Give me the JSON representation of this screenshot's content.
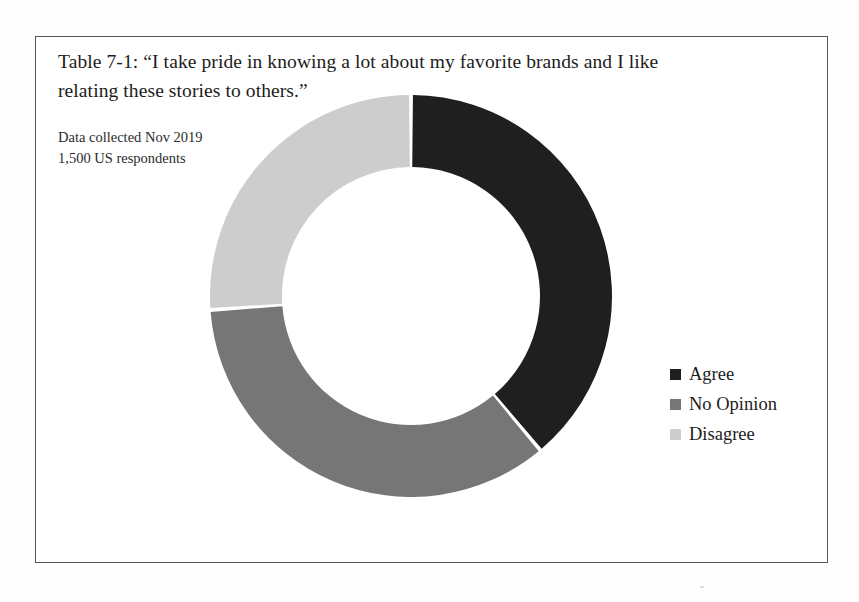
{
  "figure": {
    "title": "Table 7-1: “I take pride in knowing a lot about my favorite brands and I like relating these stories to others.”",
    "subtitle_line1": "Data collected Nov 2019",
    "subtitle_line2": "1,500 US respondents",
    "frame_border_color": "#58585a"
  },
  "chart_data": {
    "type": "pie",
    "variant": "donut",
    "title": "Table 7-1: “I take pride in knowing a lot about my favorite brands and I like relating these stories to others.”",
    "subtitle": "Data collected Nov 2019 / 1,500 US respondents",
    "xlabel": "",
    "ylabel": "",
    "grid": false,
    "legend_position": "right",
    "start_angle_deg": 0,
    "direction": "clockwise",
    "inner_radius_ratio": 0.64,
    "total_respondents": 1500,
    "categories": [
      "Agree",
      "No Opinion",
      "Disagree"
    ],
    "values": [
      39,
      35,
      26
    ],
    "value_unit": "percent",
    "counts": [
      585,
      525,
      390
    ],
    "colors": [
      "#1f1f1f",
      "#767676",
      "#cdcdcd"
    ],
    "slices": [
      {
        "label": "Agree",
        "percent": 39,
        "count": 585,
        "color": "#1f1f1f",
        "start_deg": 0,
        "end_deg": 140
      },
      {
        "label": "No Opinion",
        "percent": 35,
        "count": 525,
        "color": "#767676",
        "start_deg": 140,
        "end_deg": 266
      },
      {
        "label": "Disagree",
        "percent": 26,
        "count": 390,
        "color": "#cdcdcd",
        "start_deg": 266,
        "end_deg": 360
      }
    ]
  },
  "legend": {
    "items": [
      {
        "label": "Agree",
        "color": "#1f1f1f"
      },
      {
        "label": "No Opinion",
        "color": "#767676"
      },
      {
        "label": "Disagree",
        "color": "#cdcdcd"
      }
    ]
  }
}
